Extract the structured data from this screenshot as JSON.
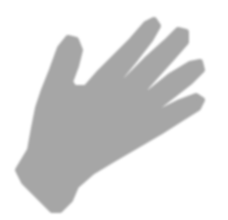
{
  "image": {
    "subject": "hand silhouette",
    "background_color": "#ffffff",
    "fill_color": "#a6a6a6"
  }
}
